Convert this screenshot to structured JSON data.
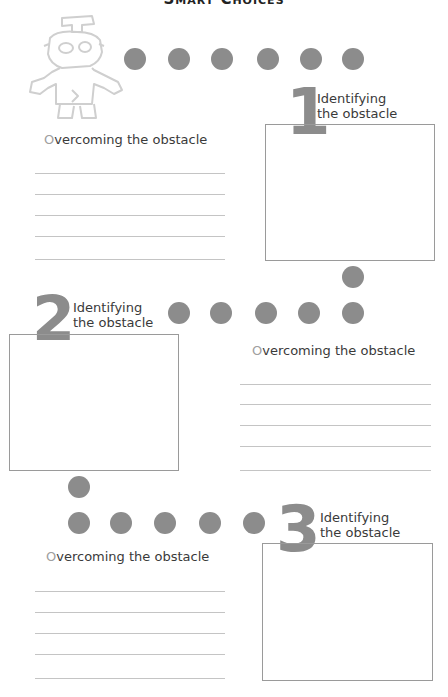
{
  "title": "Smart Choices",
  "colors": {
    "dot": "#8c8c8c",
    "numeral": "#8c8c8c",
    "box_border": "#9a9a9a",
    "line": "#c4c4c4",
    "text": "#3a3a3a",
    "initial": "#a0a0a0"
  },
  "robot_icon": "robot-outline-icon",
  "sections": [
    {
      "number": "1",
      "identify_line1": "Identifying",
      "identify_line2": "the obstacle",
      "overcome_initial": "O",
      "overcome_rest": "vercoming the obstacle",
      "answer_lines": 5
    },
    {
      "number": "2",
      "identify_line1": "Identifying",
      "identify_line2": "the obstacle",
      "overcome_initial": "O",
      "overcome_rest": "vercoming the obstacle",
      "answer_lines": 5
    },
    {
      "number": "3",
      "identify_line1": "Identifying",
      "identify_line2": "the obstacle",
      "overcome_initial": "O",
      "overcome_rest": "vercoming the obstacle",
      "answer_lines": 5
    }
  ]
}
